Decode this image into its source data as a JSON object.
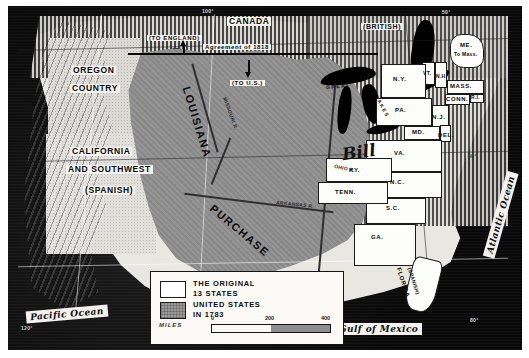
{
  "map": {
    "title": "Louisiana Purchase and the United States in 1783",
    "regions": {
      "oregon": "OREGON\nCOUNTRY",
      "oregon_line1": "OREGON",
      "oregon_line2": "COUNTRY",
      "california_line1": "CALIFORNIA",
      "california_line2": "AND SOUTHWEST",
      "california_line3": "(SPANISH)",
      "louisiana_word1": "LOUISIANA",
      "louisiana_word2": "PURCHASE",
      "canada": "CANADA",
      "canada_qualifier": "(BRITISH)",
      "florida": "FLORIDA",
      "florida_qualifier": "(SPANISH)"
    },
    "annotations": {
      "to_england": "(TO ENGLAND)",
      "to_us": "(TO U.S.)",
      "agreement": "Agreement of 1818",
      "great_lakes_1": "GREAT",
      "great_lakes_2": "LAKES",
      "script_mark": "Bill"
    },
    "oceans": {
      "pacific": "Pacific Ocean",
      "atlantic": "Atlantic Ocean",
      "gulf": "Gulf of Mexico"
    },
    "rivers": [
      {
        "name": "MISSOURI R."
      },
      {
        "name": "ARKANSAS R."
      },
      {
        "name": "OHIO R."
      }
    ],
    "graticule": [
      {
        "label": "50°"
      },
      {
        "label": "100°"
      },
      {
        "label": "120°"
      },
      {
        "label": "80°"
      },
      {
        "label": "40°"
      }
    ],
    "states": [
      {
        "abbr": "ME.",
        "note": "To Mass."
      },
      {
        "abbr": "VT."
      },
      {
        "abbr": "N.H."
      },
      {
        "abbr": "MASS."
      },
      {
        "abbr": "N.Y."
      },
      {
        "abbr": "R.I."
      },
      {
        "abbr": "CONN."
      },
      {
        "abbr": "PA."
      },
      {
        "abbr": "N.J."
      },
      {
        "abbr": "MD."
      },
      {
        "abbr": "DEL."
      },
      {
        "abbr": "VA."
      },
      {
        "abbr": "KY."
      },
      {
        "abbr": "TENN."
      },
      {
        "abbr": "N.C."
      },
      {
        "abbr": "S.C."
      },
      {
        "abbr": "GA."
      }
    ]
  },
  "legend": {
    "entry1_line1": "THE  ORIGINAL",
    "entry1_line2": "13  STATES",
    "entry2_line1": "UNITED  STATES",
    "entry2_line2": "IN  1783",
    "miles_label": "MILES",
    "scale_ticks": [
      "0",
      "200",
      "400"
    ]
  },
  "colors": {
    "purchase_fill": "#8f8f8f",
    "original_states": "#ffffff",
    "ocean": "#0c0c0c",
    "land": "#e9e7e2"
  }
}
